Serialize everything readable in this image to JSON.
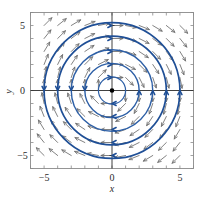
{
  "figure": {
    "kind": "phase-portrait",
    "background": "#ffffff"
  },
  "chart_data": {
    "type": "scatter",
    "title": "",
    "xlabel": "x",
    "ylabel": "y",
    "xlim": [
      -6,
      6
    ],
    "ylim": [
      -6,
      6
    ],
    "xticks": [
      -5,
      0,
      5
    ],
    "yticks": [
      -5,
      0,
      5
    ],
    "xtick_labels": [
      "−5",
      "0",
      "5"
    ],
    "ytick_labels": [
      "−5",
      "0",
      "5"
    ],
    "grid": false,
    "legend": null,
    "colors": {
      "trajectory": "#2d5fa6",
      "trajectory_dark": "#1f4f96",
      "vector_arrow": "#6b6b6b",
      "axis": "#2b2b2b",
      "frame": "#8a8a8a",
      "equilibrium": "#000000"
    },
    "equilibrium_points": [
      {
        "x": 0,
        "y": 0,
        "kind": "center"
      }
    ],
    "trajectories": {
      "shape": "circle",
      "center": [
        0,
        0
      ],
      "radii": [
        1,
        2,
        3,
        4,
        5
      ],
      "direction": "clockwise",
      "arrow_angles_deg": [
        90,
        180,
        270,
        0
      ]
    },
    "vector_field": {
      "formula_direction": "clockwise",
      "u_expression": "y",
      "v_expression": "-x",
      "sample_spacing": 1,
      "sample_range": [
        -5,
        5
      ],
      "arrow_color": "#6b6b6b"
    },
    "frame": {
      "left": -6,
      "right": 6,
      "bottom": -6,
      "top": 6,
      "minor_ticks_per_unit": 1
    }
  }
}
